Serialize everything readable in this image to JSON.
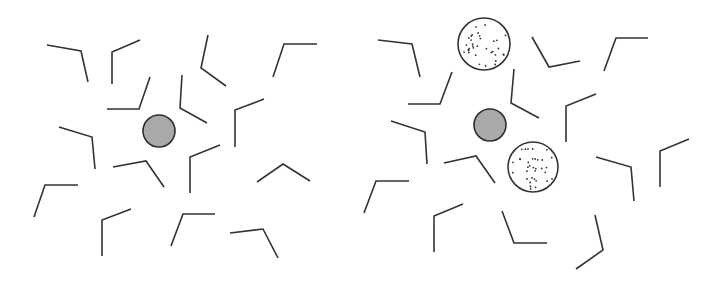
{
  "figure": {
    "width": 717,
    "height": 286,
    "colors": {
      "background": "#ffffff",
      "stroke": "#333333",
      "center_fill": "#a9a9a9",
      "center_stroke": "#2e2e2e",
      "dotted_fill": "#ffffff",
      "dot": "#333333"
    },
    "stroke_width": 1.6
  },
  "panels": [
    {
      "name": "left-panel",
      "center_particle": {
        "cx": 159,
        "cy": 131,
        "r": 16
      },
      "dotted_particles": [],
      "bent_molecules": [
        [
          [
            47,
            45
          ],
          [
            81,
            51
          ],
          [
            88,
            82
          ]
        ],
        [
          [
            112,
            84
          ],
          [
            112,
            52
          ],
          [
            140,
            40
          ]
        ],
        [
          [
            150,
            77
          ],
          [
            139,
            109
          ],
          [
            107,
            109
          ]
        ],
        [
          [
            208,
            35
          ],
          [
            201,
            68
          ],
          [
            226,
            86
          ]
        ],
        [
          [
            273,
            77
          ],
          [
            284,
            44
          ],
          [
            317,
            44
          ]
        ],
        [
          [
            182,
            75
          ],
          [
            180,
            108
          ],
          [
            207,
            123
          ]
        ],
        [
          [
            235,
            147
          ],
          [
            235,
            110
          ],
          [
            264,
            99
          ]
        ],
        [
          [
            59,
            127
          ],
          [
            92,
            137
          ],
          [
            95,
            169
          ]
        ],
        [
          [
            113,
            167
          ],
          [
            146,
            161
          ],
          [
            164,
            187
          ]
        ],
        [
          [
            190,
            193
          ],
          [
            190,
            157
          ],
          [
            220,
            145
          ]
        ],
        [
          [
            257,
            182
          ],
          [
            283,
            164
          ],
          [
            310,
            181
          ]
        ],
        [
          [
            34,
            217
          ],
          [
            45,
            185
          ],
          [
            78,
            185
          ]
        ],
        [
          [
            102,
            256
          ],
          [
            102,
            220
          ],
          [
            131,
            209
          ]
        ],
        [
          [
            171,
            246
          ],
          [
            183,
            214
          ],
          [
            215,
            214
          ]
        ],
        [
          [
            230,
            233
          ],
          [
            263,
            229
          ],
          [
            278,
            258
          ]
        ]
      ]
    },
    {
      "name": "right-panel",
      "center_particle": {
        "cx": 490,
        "cy": 125,
        "r": 16
      },
      "dotted_particles": [
        {
          "cx": 484,
          "cy": 44,
          "r": 26
        },
        {
          "cx": 533,
          "cy": 167,
          "r": 25
        }
      ],
      "bent_molecules": [
        [
          [
            378,
            40
          ],
          [
            412,
            44
          ],
          [
            420,
            77
          ]
        ],
        [
          [
            532,
            37
          ],
          [
            549,
            67
          ],
          [
            580,
            61
          ]
        ],
        [
          [
            604,
            71
          ],
          [
            616,
            38
          ],
          [
            648,
            38
          ]
        ],
        [
          [
            452,
            72
          ],
          [
            440,
            104
          ],
          [
            408,
            104
          ]
        ],
        [
          [
            514,
            69
          ],
          [
            511,
            103
          ],
          [
            539,
            118
          ]
        ],
        [
          [
            596,
            94
          ],
          [
            566,
            106
          ],
          [
            566,
            142
          ]
        ],
        [
          [
            391,
            121
          ],
          [
            425,
            132
          ],
          [
            427,
            164
          ]
        ],
        [
          [
            444,
            163
          ],
          [
            476,
            156
          ],
          [
            495,
            183
          ]
        ],
        [
          [
            596,
            157
          ],
          [
            631,
            167
          ],
          [
            634,
            201
          ]
        ],
        [
          [
            689,
            139
          ],
          [
            660,
            151
          ],
          [
            660,
            187
          ]
        ],
        [
          [
            364,
            213
          ],
          [
            376,
            181
          ],
          [
            409,
            181
          ]
        ],
        [
          [
            463,
            204
          ],
          [
            434,
            216
          ],
          [
            434,
            252
          ]
        ],
        [
          [
            502,
            211
          ],
          [
            514,
            243
          ],
          [
            547,
            243
          ]
        ],
        [
          [
            595,
            215
          ],
          [
            603,
            250
          ],
          [
            576,
            269
          ]
        ]
      ]
    }
  ]
}
